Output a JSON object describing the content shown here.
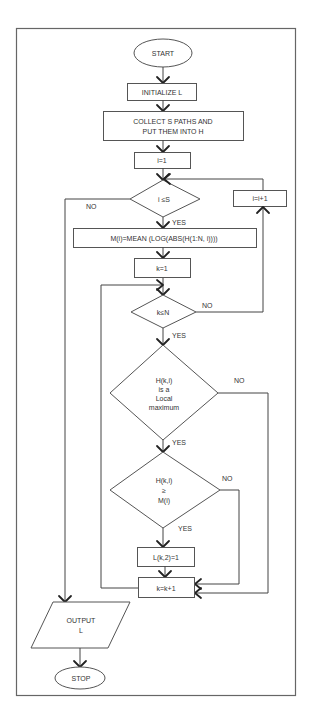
{
  "flowchart": {
    "start": "START",
    "initialize": "INITIALIZE L",
    "collect": [
      "COLLECT S PATHS AND",
      "PUT THEM INTO H"
    ],
    "i_init": "i=1",
    "i_cond": "i ≤S",
    "i_incr": "i=i+1",
    "mean": "M(i)=MEAN (LOG(ABS(H(1:N, i))))",
    "k_init": "k=1",
    "k_cond": "k≤N",
    "local_max": [
      "H(k,i)",
      "is a",
      "Local",
      "maximum"
    ],
    "compare": [
      "H(k,i)",
      "≥",
      "M(i)"
    ],
    "set_l": "L(k,2)=1",
    "k_incr": "k=k+1",
    "output": [
      "OUTPUT",
      "L"
    ],
    "stop": "STOP",
    "labels": {
      "yes": "YES",
      "no": "NO"
    }
  }
}
